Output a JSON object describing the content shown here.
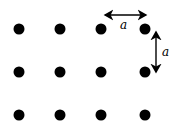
{
  "diagram": {
    "dot_color": "#000000",
    "columns_x": [
      19,
      60,
      101,
      145
    ],
    "rows_y": [
      29,
      72,
      115
    ],
    "dot_radius": 5.5,
    "spacing_label_horizontal": "a",
    "spacing_label_vertical": "a"
  }
}
